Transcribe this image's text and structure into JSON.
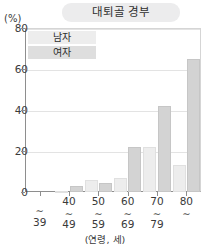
{
  "chart_data": {
    "type": "bar",
    "title": "대퇴골 경부",
    "xlabel": "(연령, 세)",
    "ylabel": "(%)",
    "categories": [
      "∼\n39",
      "40\n∼\n49",
      "50\n∼\n59",
      "60\n∼\n69",
      "70\n∼\n79",
      "80\n∼"
    ],
    "category_lines": [
      [
        "∼",
        "39"
      ],
      [
        "40",
        "∼",
        "49"
      ],
      [
        "50",
        "∼",
        "59"
      ],
      [
        "60",
        "∼",
        "69"
      ],
      [
        "70",
        "∼",
        "79"
      ],
      [
        "80",
        "∼"
      ]
    ],
    "series": [
      {
        "name": "남자",
        "values": [
          0,
          0.5,
          6,
          7,
          22,
          13
        ],
        "color": "#ededed"
      },
      {
        "name": "여자",
        "values": [
          0,
          3,
          4.5,
          22,
          42,
          65
        ],
        "color": "#d3d3d3"
      }
    ],
    "ylim": [
      0,
      80
    ],
    "yticks": [
      0,
      20,
      40,
      60,
      80
    ],
    "ytick_labels": [
      "0",
      "20",
      "40",
      "60",
      "80"
    ],
    "grid": true,
    "legend_position": "top-left"
  },
  "legend": {
    "items": [
      {
        "label": "남자"
      },
      {
        "label": "여자"
      }
    ]
  }
}
